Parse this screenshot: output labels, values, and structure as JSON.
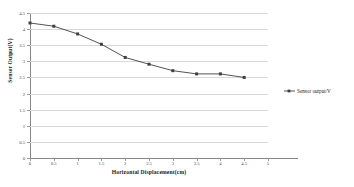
{
  "chart_data": {
    "type": "line",
    "title": "",
    "xlabel": "Horizontal Displacement(cm)",
    "ylabel": "Sensor Output(V)",
    "xlim": [
      0,
      5
    ],
    "ylim": [
      0,
      4.5
    ],
    "xticks": [
      "0",
      "0.5",
      "1",
      "1.5",
      "2",
      "2.5",
      "3",
      "3.5",
      "4",
      "4.5",
      "5"
    ],
    "xtick_values": [
      0,
      0.5,
      1,
      1.5,
      2,
      2.5,
      3,
      3.5,
      4,
      4.5,
      5
    ],
    "yticks": [
      "0",
      "0.5",
      "1",
      "1.5",
      "2",
      "2.5",
      "3",
      "3.5",
      "4",
      "4.5"
    ],
    "ytick_values": [
      0,
      0.5,
      1,
      1.5,
      2,
      2.5,
      3,
      3.5,
      4,
      4.5
    ],
    "grid": "horizontal",
    "legend_position": "right",
    "series": [
      {
        "name": "Sensor output/V",
        "color": "#404040",
        "marker": "square",
        "x": [
          0,
          0.5,
          1,
          1.5,
          2,
          2.5,
          3,
          3.5,
          4,
          4.5
        ],
        "values": [
          4.19,
          4.09,
          3.85,
          3.53,
          3.12,
          2.91,
          2.71,
          2.61,
          2.61,
          2.5
        ]
      }
    ]
  },
  "legend": {
    "entries": [
      {
        "label": "Sensor output/V"
      }
    ]
  }
}
